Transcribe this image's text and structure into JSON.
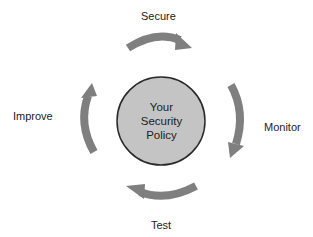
{
  "diagram": {
    "type": "cycle",
    "center": {
      "lines": [
        "Your",
        "Security",
        "Policy"
      ],
      "fill": "#c4c4c4",
      "stroke": "#2a2a2a"
    },
    "arrow_color": "#7f7f7f",
    "steps": [
      {
        "label": "Secure",
        "position": "top"
      },
      {
        "label": "Monitor",
        "position": "right"
      },
      {
        "label": "Test",
        "position": "bottom"
      },
      {
        "label": "Improve",
        "position": "left"
      }
    ]
  }
}
